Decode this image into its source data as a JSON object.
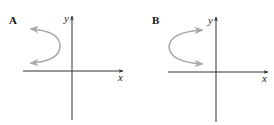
{
  "figure": {
    "panels": [
      {
        "label": "A",
        "x_axis_label": "x",
        "y_axis_label": "y",
        "curve": "parabola opening left with arrows pointing left, located in second quadrant",
        "curve_direction": "left"
      },
      {
        "label": "B",
        "x_axis_label": "x",
        "y_axis_label": "y",
        "curve": "parabola opening right with arrows pointing right, located in second quadrant",
        "curve_direction": "right"
      }
    ],
    "colors": {
      "axis": "#333333",
      "curve": "#a9a9a9",
      "text": "#111111"
    }
  }
}
